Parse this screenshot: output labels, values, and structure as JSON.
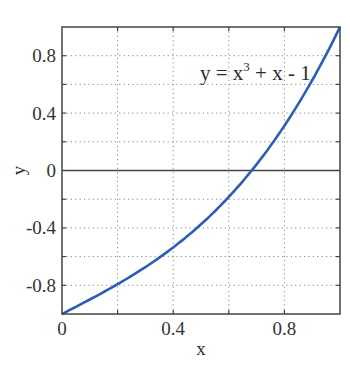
{
  "chart_data": {
    "type": "line",
    "title": "",
    "xlabel": "x",
    "ylabel": "y",
    "xlim": [
      0,
      1
    ],
    "ylim": [
      -1,
      1
    ],
    "grid": true,
    "grid_style": "dotted",
    "x_ticks": [
      0,
      0.4,
      0.8
    ],
    "x_tick_labels": [
      "0",
      "0.4",
      "0.8"
    ],
    "x_minor_grid": [
      0.2,
      0.4,
      0.6,
      0.8
    ],
    "y_ticks": [
      0.8,
      0.4,
      0,
      -0.4,
      -0.8
    ],
    "y_tick_labels": [
      "0.8",
      "0.4",
      "0",
      "-0.4",
      "-0.8"
    ],
    "y_minor_grid": [
      -0.8,
      -0.6,
      -0.4,
      -0.2,
      0.2,
      0.4,
      0.6,
      0.8
    ],
    "zero_line": true,
    "annotation": {
      "text": "y = x³ + x - 1",
      "parts": {
        "lhs": "y = x",
        "sup": "3",
        "rhs": " + x - 1"
      },
      "x": 0.5,
      "y": 0.6
    },
    "series": [
      {
        "name": "y = x^3 + x - 1",
        "color": "#2a5fb5",
        "x": [
          0,
          0.1,
          0.2,
          0.3,
          0.4,
          0.5,
          0.6,
          0.7,
          0.8,
          0.9,
          1.0
        ],
        "y": [
          -1,
          -0.899,
          -0.792,
          -0.673,
          -0.536,
          -0.375,
          -0.184,
          0.043,
          0.312,
          0.629,
          1
        ]
      }
    ]
  },
  "colors": {
    "axis": "#444444",
    "grid": "#888888",
    "curve": "#2a5fb5"
  }
}
